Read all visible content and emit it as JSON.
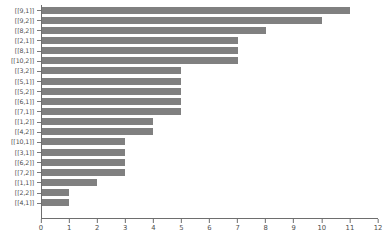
{
  "chart_data": {
    "type": "bar",
    "orientation": "horizontal",
    "title": "",
    "xlabel": "",
    "ylabel": "",
    "xlim": [
      0,
      12
    ],
    "ylim": null,
    "grid": false,
    "legend": null,
    "bar_color": "#808080",
    "axis_color": "#6e6e6e",
    "tick_label_color": "#4d4d4d",
    "xticks": [
      0,
      1,
      2,
      3,
      4,
      5,
      6,
      7,
      8,
      9,
      10,
      11,
      12
    ],
    "xticklabels": [
      "0",
      "1",
      "2",
      "3",
      "4",
      "5",
      "6",
      "7",
      "8",
      "9",
      "10",
      "11",
      "12"
    ],
    "categories": [
      "[[9,1]]",
      "[[9,2]]",
      "[[8,2]]",
      "[[2,1]]",
      "[[8,1]]",
      "[[10,2]]",
      "[[3,2]]",
      "[[5,1]]",
      "[[5,2]]",
      "[[6,1]]",
      "[[7,1]]",
      "[[1,2]]",
      "[[4,2]]",
      "[[10,1]]",
      "[[3,1]]",
      "[[6,2]]",
      "[[7,2]]",
      "[[1,1]]",
      "[[2,2]]",
      "[[4,1]]"
    ],
    "values": [
      11,
      10,
      8,
      7,
      7,
      7,
      5,
      5,
      5,
      5,
      5,
      4,
      4,
      3,
      3,
      3,
      3,
      2,
      1,
      1
    ]
  }
}
